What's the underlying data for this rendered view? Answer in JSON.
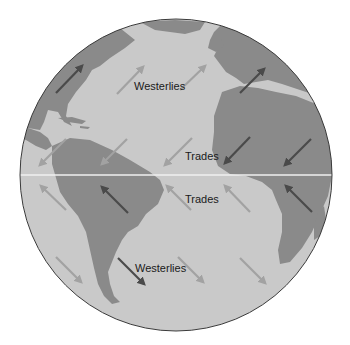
{
  "diagram": {
    "colors": {
      "background": "#ffffff",
      "ocean": "#c9c9c9",
      "land": "#8a8a8a",
      "outline": "#3a3a3a",
      "equator": "#efefef",
      "arrow_light": "#a2a2a2",
      "arrow_dark": "#4a4a4a"
    },
    "labels": {
      "westerlies_north": "Westerlies",
      "trades_north": "Trades",
      "trades_south": "Trades",
      "westerlies_south": "Westerlies"
    },
    "wind_arrows": [
      {
        "zone": "westerlies-north",
        "direction": "northeast",
        "x1": 56,
        "y1": 93,
        "x2": 82,
        "y2": 66,
        "tone": "dark"
      },
      {
        "zone": "westerlies-north",
        "direction": "northeast",
        "x1": 117,
        "y1": 94,
        "x2": 143,
        "y2": 67,
        "tone": "light"
      },
      {
        "zone": "westerlies-north",
        "direction": "northeast",
        "x1": 180,
        "y1": 90,
        "x2": 205,
        "y2": 66,
        "tone": "light"
      },
      {
        "zone": "westerlies-north",
        "direction": "northeast",
        "x1": 240,
        "y1": 93,
        "x2": 264,
        "y2": 69,
        "tone": "dark"
      },
      {
        "zone": "trades-north",
        "direction": "southwest",
        "x1": 66,
        "y1": 139,
        "x2": 40,
        "y2": 165,
        "tone": "light"
      },
      {
        "zone": "trades-north",
        "direction": "southwest",
        "x1": 127,
        "y1": 139,
        "x2": 102,
        "y2": 164,
        "tone": "light"
      },
      {
        "zone": "trades-north",
        "direction": "southwest",
        "x1": 192,
        "y1": 138,
        "x2": 165,
        "y2": 165,
        "tone": "light"
      },
      {
        "zone": "trades-north",
        "direction": "southwest",
        "x1": 250,
        "y1": 137,
        "x2": 225,
        "y2": 163,
        "tone": "dark"
      },
      {
        "zone": "trades-north",
        "direction": "southwest",
        "x1": 311,
        "y1": 139,
        "x2": 285,
        "y2": 165,
        "tone": "dark"
      },
      {
        "zone": "trades-south",
        "direction": "northwest",
        "x1": 66,
        "y1": 210,
        "x2": 41,
        "y2": 186,
        "tone": "light"
      },
      {
        "zone": "trades-south",
        "direction": "northwest",
        "x1": 128,
        "y1": 213,
        "x2": 102,
        "y2": 187,
        "tone": "dark"
      },
      {
        "zone": "trades-south",
        "direction": "northwest",
        "x1": 191,
        "y1": 210,
        "x2": 167,
        "y2": 186,
        "tone": "light"
      },
      {
        "zone": "trades-south",
        "direction": "northwest",
        "x1": 250,
        "y1": 212,
        "x2": 225,
        "y2": 186,
        "tone": "light"
      },
      {
        "zone": "trades-south",
        "direction": "northwest",
        "x1": 312,
        "y1": 212,
        "x2": 286,
        "y2": 186,
        "tone": "dark"
      },
      {
        "zone": "westerlies-south",
        "direction": "southeast",
        "x1": 56,
        "y1": 257,
        "x2": 81,
        "y2": 282,
        "tone": "light"
      },
      {
        "zone": "westerlies-south",
        "direction": "southeast",
        "x1": 118,
        "y1": 258,
        "x2": 144,
        "y2": 284,
        "tone": "dark"
      },
      {
        "zone": "westerlies-south",
        "direction": "southeast",
        "x1": 178,
        "y1": 257,
        "x2": 203,
        "y2": 282,
        "tone": "light"
      },
      {
        "zone": "westerlies-south",
        "direction": "southeast",
        "x1": 240,
        "y1": 258,
        "x2": 265,
        "y2": 283,
        "tone": "light"
      }
    ]
  }
}
